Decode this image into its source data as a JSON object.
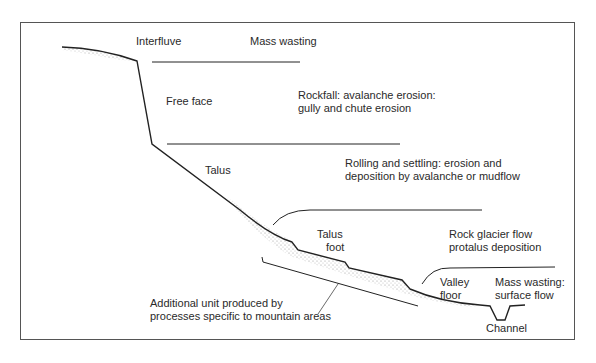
{
  "diagram": {
    "type": "slope-profile",
    "zones": {
      "interfluve": "Interfluve",
      "free_face": "Free face",
      "talus": "Talus",
      "talus_foot": [
        "Talus",
        "foot"
      ],
      "valley_floor": [
        "Valley",
        "floor"
      ],
      "channel": "Channel"
    },
    "processes": {
      "mass_wasting": "Mass wasting",
      "rockfall": [
        "Rockfall: avalanche erosion:",
        "gully and chute erosion"
      ],
      "rolling": [
        "Rolling and settling: erosion and",
        "deposition by avalanche or mudflow"
      ],
      "rock_glacier": [
        "Rock glacier flow",
        "protalus deposition"
      ],
      "mass_wasting_surface": [
        "Mass wasting:",
        "surface flow"
      ]
    },
    "annotation": [
      "Additional unit produced by",
      "processes specific to mountain areas"
    ]
  }
}
